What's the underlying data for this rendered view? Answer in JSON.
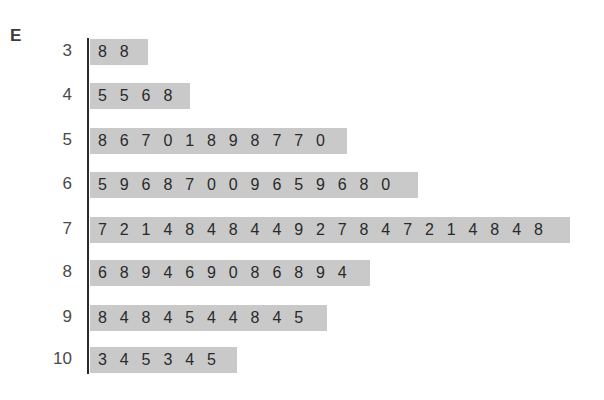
{
  "panel_label": "E",
  "chart_data": {
    "type": "table",
    "subtype": "stem-and-leaf",
    "title": "",
    "panel_label": "E",
    "rows": [
      {
        "stem": "3",
        "leaves": [
          8,
          8
        ]
      },
      {
        "stem": "4",
        "leaves": [
          5,
          5,
          6,
          8
        ]
      },
      {
        "stem": "5",
        "leaves": [
          8,
          6,
          7,
          0,
          1,
          8,
          9,
          8,
          7,
          7,
          0
        ]
      },
      {
        "stem": "6",
        "leaves": [
          5,
          9,
          6,
          8,
          7,
          0,
          0,
          9,
          6,
          5,
          9,
          6,
          8,
          0
        ]
      },
      {
        "stem": "7",
        "leaves": [
          7,
          2,
          1,
          4,
          8,
          4,
          8,
          4,
          4,
          9,
          2,
          7,
          8,
          4,
          7,
          2,
          1,
          4,
          8,
          4,
          8
        ]
      },
      {
        "stem": "8",
        "leaves": [
          6,
          8,
          9,
          4,
          6,
          9,
          0,
          8,
          6,
          8,
          9,
          4
        ]
      },
      {
        "stem": "9",
        "leaves": [
          8,
          4,
          8,
          4,
          5,
          4,
          4,
          8,
          4,
          5
        ]
      },
      {
        "stem": "10",
        "leaves": [
          3,
          4,
          5,
          3,
          4,
          5
        ]
      }
    ],
    "counts": [
      2,
      4,
      11,
      14,
      21,
      12,
      10,
      6
    ]
  },
  "layout": {
    "row_tops": [
      39,
      83,
      128,
      172,
      217,
      260,
      305,
      347
    ],
    "bar_widths": [
      58,
      100,
      257,
      328,
      480,
      280,
      237,
      147
    ]
  }
}
